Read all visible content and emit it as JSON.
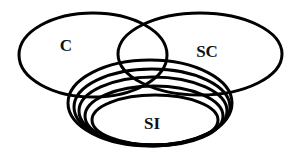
{
  "diagram": {
    "type": "venn",
    "stroke_color": "#000000",
    "background": "#ffffff",
    "sets": [
      {
        "id": "C",
        "label": "C",
        "cx": 93,
        "cy": 55,
        "rx": 74,
        "ry": 42,
        "label_x": 66,
        "label_y": 51
      },
      {
        "id": "SC",
        "label": "SC",
        "cx": 200,
        "cy": 54,
        "rx": 82,
        "ry": 41,
        "label_x": 207,
        "label_y": 57
      }
    ],
    "nested_group": {
      "id": "SI",
      "label": "SI",
      "label_x": 152,
      "label_y": 129,
      "ellipses": [
        {
          "cx": 150,
          "cy": 103,
          "rx": 82,
          "ry": 43
        },
        {
          "cx": 152,
          "cy": 107,
          "rx": 78,
          "ry": 38
        },
        {
          "cx": 153,
          "cy": 111,
          "rx": 74,
          "ry": 34
        },
        {
          "cx": 154,
          "cy": 116,
          "rx": 69,
          "ry": 30
        },
        {
          "cx": 155,
          "cy": 120,
          "rx": 63,
          "ry": 25
        }
      ]
    }
  }
}
